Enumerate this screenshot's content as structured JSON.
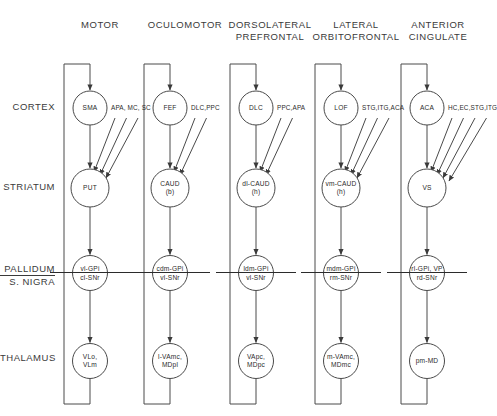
{
  "figure": {
    "line_color": "#4a4a4a",
    "text_color": "#2b2b2b",
    "background": "#ffffff"
  },
  "row_labels": [
    {
      "id": "cortex",
      "line1": "CORTEX",
      "line2": ""
    },
    {
      "id": "striatum",
      "line1": "STRIATUM",
      "line2": ""
    },
    {
      "id": "pallidum",
      "line1": "PALLIDUM",
      "line2": "S. NIGRA"
    },
    {
      "id": "thalamus",
      "line1": "THALAMUS",
      "line2": ""
    }
  ],
  "columns": [
    {
      "id": "motor",
      "header_line1": "MOTOR",
      "header_line2": "",
      "cortex": {
        "line1": "SMA",
        "line2": ""
      },
      "cortex_inputs": "APA, MC, SC",
      "cortex_input_count": 3,
      "striatum": {
        "line1": "PUT",
        "line2": ""
      },
      "pallidum": {
        "line1": "vl-GPi",
        "line2": "cl-SNr"
      },
      "thalamus": {
        "line1": "VLo,",
        "line2": "VLm"
      }
    },
    {
      "id": "oculomotor",
      "header_line1": "OCULOMOTOR",
      "header_line2": "",
      "cortex": {
        "line1": "FEF",
        "line2": ""
      },
      "cortex_inputs": "DLC,PPC",
      "cortex_input_count": 2,
      "striatum": {
        "line1": "CAUD",
        "line2": "(b)"
      },
      "pallidum": {
        "line1": "cdm-GPi",
        "line2": "vl-SNr"
      },
      "thalamus": {
        "line1": "l-VAmc,",
        "line2": "MDpl"
      }
    },
    {
      "id": "dorsolateral-prefrontal",
      "header_line1": "DORSOLATERAL",
      "header_line2": "PREFRONTAL",
      "cortex": {
        "line1": "DLC",
        "line2": ""
      },
      "cortex_inputs": "PPC,APA",
      "cortex_input_count": 2,
      "striatum": {
        "line1": "dl-CAUD",
        "line2": "(h)"
      },
      "pallidum": {
        "line1": "ldm-GPi",
        "line2": "vl-SNr"
      },
      "thalamus": {
        "line1": "VApc,",
        "line2": "MDpc"
      }
    },
    {
      "id": "lateral-orbitofrontal",
      "header_line1": "LATERAL",
      "header_line2": "ORBITOFRONTAL",
      "cortex": {
        "line1": "LOF",
        "line2": ""
      },
      "cortex_inputs": "STG,ITG,ACA",
      "cortex_input_count": 3,
      "striatum": {
        "line1": "vm-CAUD",
        "line2": "(h)"
      },
      "pallidum": {
        "line1": "mdm-GPi",
        "line2": "rm-SNr"
      },
      "thalamus": {
        "line1": "m-VAmc,",
        "line2": "MDmc"
      }
    },
    {
      "id": "anterior-cingulate",
      "header_line1": "ANTERIOR",
      "header_line2": "CINGULATE",
      "cortex": {
        "line1": "ACA",
        "line2": ""
      },
      "cortex_inputs": "HC,EC,STG,ITG",
      "cortex_input_count": 4,
      "striatum": {
        "line1": "VS",
        "line2": ""
      },
      "pallidum": {
        "line1": "rl-GPi, VP",
        "line2": "rd-SNr"
      },
      "thalamus": {
        "line1": "pm-MD",
        "line2": ""
      }
    }
  ]
}
